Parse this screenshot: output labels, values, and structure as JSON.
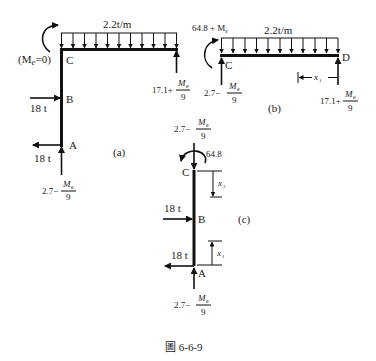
{
  "figure": {
    "caption": "圖 6-6-9",
    "panels": {
      "a": {
        "tag": "(a)",
        "load_label": "2.2t/m",
        "moment_label": "(M",
        "moment_sub": "e",
        "moment_tail": "=0)",
        "node_c": "C",
        "node_b": "B",
        "node_a": "A",
        "force_b": "18 t",
        "force_a": "18 t",
        "reaction_right_prefix": "17.1+",
        "reaction_bottom_prefix": "2.7−",
        "frac_num": "M",
        "frac_sub": "e",
        "frac_den": "9"
      },
      "b": {
        "tag": "(b)",
        "load_label": "2.2t/m",
        "moment_label": "64.8 + M",
        "moment_sub": "e",
        "node_c": "C",
        "node_d": "D",
        "dim_label": "x",
        "dim_sub": "1",
        "reaction_left_prefix": "2.7−",
        "reaction_right_prefix": "17.1+",
        "frac_num": "M",
        "frac_sub": "e",
        "frac_den": "9"
      },
      "c": {
        "tag": "(c)",
        "top_reaction_prefix": "2.7−",
        "moment_label": "64.8",
        "node_c": "C",
        "node_b": "B",
        "node_a": "A",
        "force_b": "18 t",
        "force_a": "18 t",
        "dim_top": "x",
        "dim_top_sub": "2",
        "dim_bottom": "x",
        "dim_bottom_sub": "1",
        "reaction_bottom_prefix": "2.7−",
        "frac_num": "M",
        "frac_sub": "e",
        "frac_den": "9"
      }
    }
  }
}
